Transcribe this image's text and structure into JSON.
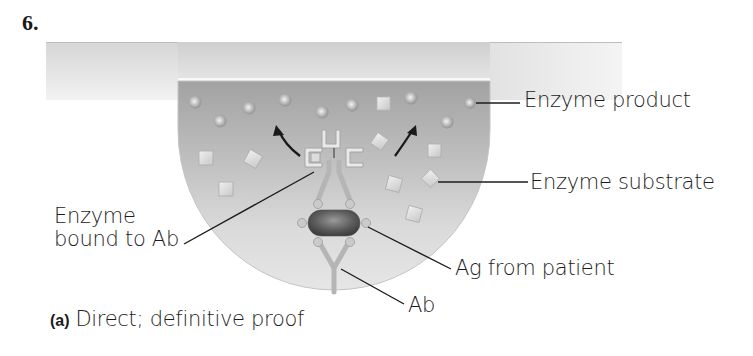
{
  "question_number": "6.",
  "labels": {
    "enzyme_product": "Enzyme product",
    "enzyme_substrate": "Enzyme substrate",
    "enzyme_bound_line1": "Enzyme",
    "enzyme_bound_line2": "bound to Ab",
    "ag_from_patient": "Ag from patient",
    "ab": "Ab"
  },
  "caption": {
    "tag": "(a)",
    "text": "Direct; definitive proof"
  },
  "colors": {
    "band_light": "#e6e6e6",
    "liquid_dark": "#a7a7a7",
    "liquid_light": "#e2e2e2",
    "antigen": "#6a6a6a",
    "antibody": "#cfcfcf",
    "ink": "#1c1c1c"
  }
}
